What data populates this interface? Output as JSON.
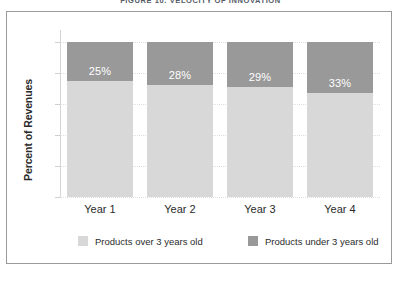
{
  "figure": {
    "title": "FIGURE 10. VELOCITY OF INNOVATION"
  },
  "axes": {
    "ylabel": "Percent of Revenues"
  },
  "legend": {
    "items": [
      {
        "label": "Products over 3 years old",
        "color": "#d8d8d8",
        "swatch_name": "legend-swatch-light"
      },
      {
        "label": "Products under 3 years old",
        "color": "#999999",
        "swatch_name": "legend-swatch-dark"
      }
    ]
  },
  "chart_data": {
    "type": "bar",
    "stacked": true,
    "title": "FIGURE 10. VELOCITY OF INNOVATION",
    "xlabel": "",
    "ylabel": "Percent of Revenues",
    "ylim": [
      0,
      100
    ],
    "grid": true,
    "legend_position": "bottom",
    "categories": [
      "Year 1",
      "Year 2",
      "Year 3",
      "Year 4"
    ],
    "series": [
      {
        "name": "Products under 3 years old",
        "color": "#999999",
        "values": [
          25,
          28,
          29,
          33
        ],
        "labels": [
          "25%",
          "28%",
          "29%",
          "33%"
        ]
      },
      {
        "name": "Products over 3 years old",
        "color": "#d8d8d8",
        "values": [
          75,
          72,
          71,
          67
        ],
        "labels": [
          "",
          "",
          "",
          ""
        ]
      }
    ]
  }
}
